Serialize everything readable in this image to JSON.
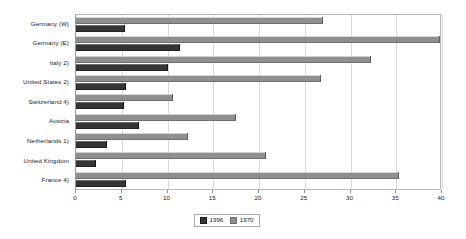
{
  "chart_data": {
    "type": "bar",
    "orientation": "horizontal",
    "title": "",
    "xlabel": "",
    "ylabel": "",
    "xlim": [
      0,
      40
    ],
    "xticks": [
      0,
      5,
      10,
      15,
      20,
      25,
      30,
      35,
      40
    ],
    "xtick_labels": [
      "0",
      "5",
      "10",
      "15",
      "20",
      "25",
      "30",
      "35",
      "40"
    ],
    "grid": true,
    "legend_position": "bottom-center",
    "categories": [
      "Germany (W)",
      "Germany (E)",
      "Italy 2)",
      "United States 2)",
      "Switzerland 4)",
      "Austria",
      "Netherlands 1)",
      "United Kingdom",
      "France 4)"
    ],
    "series": [
      {
        "name": "1996",
        "color": "#353535",
        "values": [
          5.4,
          11.4,
          10.1,
          5.5,
          5.3,
          6.9,
          3.4,
          2.2,
          5.5
        ]
      },
      {
        "name": "1970",
        "color": "#8f8f8f",
        "values": [
          27.0,
          39.8,
          32.2,
          26.8,
          10.6,
          17.5,
          12.2,
          20.8,
          35.3
        ]
      }
    ]
  },
  "legend": {
    "items": [
      {
        "label": "1996",
        "swatch": "dark-gray-swatch"
      },
      {
        "label": "1970",
        "swatch": "light-gray-swatch"
      }
    ]
  }
}
